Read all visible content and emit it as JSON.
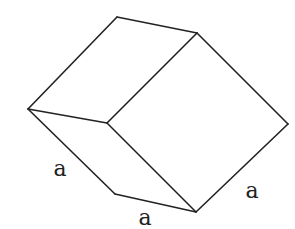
{
  "diagram": {
    "title": "",
    "shape": "rhombohedron / parallelepiped (3D wireframe)",
    "stroke_color": "#222222",
    "background": "#ffffff",
    "vertices": {
      "top": [
        117,
        17
      ],
      "top_right": [
        197,
        33
      ],
      "left": [
        28,
        109
      ],
      "center": [
        107,
        123
      ],
      "right": [
        288,
        124
      ],
      "bottom_left": [
        115,
        194
      ],
      "bottom": [
        196,
        212
      ]
    },
    "edges": [
      [
        "top",
        "top_right"
      ],
      [
        "top",
        "left"
      ],
      [
        "left",
        "center"
      ],
      [
        "center",
        "top_right"
      ],
      [
        "top_right",
        "right"
      ],
      [
        "right",
        "bottom"
      ],
      [
        "center",
        "bottom"
      ],
      [
        "left",
        "bottom_left"
      ],
      [
        "bottom_left",
        "bottom"
      ]
    ],
    "labels": [
      {
        "text": "a",
        "x": 60,
        "y": 176,
        "edge": "left-bottom_left"
      },
      {
        "text": "a",
        "x": 145,
        "y": 225,
        "edge": "bottom_left-bottom"
      },
      {
        "text": "a",
        "x": 252,
        "y": 198,
        "edge": "right-bottom"
      }
    ]
  }
}
